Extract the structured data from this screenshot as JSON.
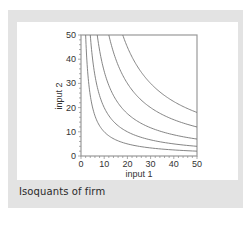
{
  "caption": "Isoquants of firm",
  "chart_data": {
    "type": "line",
    "title": "",
    "caption": "Isoquants of firm",
    "xlabel": "input 1",
    "ylabel": "input 2",
    "xlim": [
      0,
      50
    ],
    "ylim": [
      0,
      50
    ],
    "xticks": [
      0,
      10,
      20,
      30,
      40,
      50
    ],
    "yticks": [
      0,
      10,
      20,
      30,
      40,
      50
    ],
    "grid": false,
    "legend": null,
    "series": [
      {
        "name": "isoquant 1",
        "k": 100
      },
      {
        "name": "isoquant 2",
        "k": 200
      },
      {
        "name": "isoquant 3",
        "k": 350
      },
      {
        "name": "isoquant 4",
        "k": 600
      },
      {
        "name": "isoquant 5",
        "k": 900
      }
    ]
  },
  "colors": {
    "frame": "#e3e3e3",
    "card": "#ffffff",
    "curve": "#777777",
    "axis": "#999999"
  }
}
